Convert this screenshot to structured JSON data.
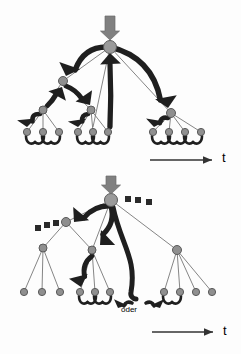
{
  "figure": {
    "title": "",
    "background_color": "#fdfdfd",
    "width": 241,
    "height": 354,
    "panels": [
      {
        "id": "top-panel",
        "name": "upper-tree-diagram",
        "description": "Tree with bold curved backtracking arrows",
        "axis": {
          "label": "t",
          "x1": 150,
          "x2": 212,
          "y": 160,
          "arrow": true
        },
        "input_arrow": {
          "x": 110,
          "y_top": 16,
          "y_bottom": 40,
          "color": "#808080"
        },
        "nodes": {
          "root": {
            "x": 110,
            "y": 47,
            "r": 6.5
          },
          "level1": [
            {
              "id": "L1a",
              "x": 63,
              "y": 81,
              "r": 4.5
            },
            {
              "id": "L1b",
              "x": 171,
              "y": 113,
              "r": 4.5
            }
          ],
          "level2": [
            {
              "id": "L2a",
              "x": 43,
              "y": 110,
              "r": 4
            },
            {
              "id": "L2b",
              "x": 91,
              "y": 110,
              "r": 4
            }
          ],
          "leaves": [
            {
              "x": 27,
              "y": 132
            },
            {
              "x": 43,
              "y": 132
            },
            {
              "x": 59,
              "y": 132
            },
            {
              "x": 78,
              "y": 132
            },
            {
              "x": 93,
              "y": 132
            },
            {
              "x": 108,
              "y": 132
            },
            {
              "x": 153,
              "y": 132
            },
            {
              "x": 169,
              "y": 132
            },
            {
              "x": 185,
              "y": 132
            },
            {
              "x": 201,
              "y": 132
            }
          ]
        },
        "curly_connectors": [
          {
            "from": 27,
            "to": 43,
            "y": 139
          },
          {
            "from": 43,
            "to": 59,
            "y": 139
          },
          {
            "from": 78,
            "to": 93,
            "y": 139
          },
          {
            "from": 93,
            "to": 108,
            "y": 139
          },
          {
            "from": 153,
            "to": 169,
            "y": 139
          },
          {
            "from": 169,
            "to": 185,
            "y": 139
          },
          {
            "from": 185,
            "to": 201,
            "y": 139
          }
        ],
        "bold_arrows": [
          {
            "name": "root-to-L1a-backtrack",
            "from": [
              110,
              47
            ],
            "to": [
              66,
              76
            ]
          },
          {
            "name": "root-to-L1b-backtrack",
            "from": [
              110,
              47
            ],
            "to": [
              168,
              108
            ]
          },
          {
            "name": "L2a-up-to-L1a",
            "from": [
              47,
              106
            ],
            "to": [
              62,
              87
            ]
          },
          {
            "name": "L1a-to-L2b",
            "from": [
              66,
              86
            ],
            "to": [
              90,
              105
            ]
          },
          {
            "name": "L2a-down-to-leaf",
            "from": [
              40,
              114
            ],
            "to": [
              27,
              127
            ]
          },
          {
            "name": "L2b-down-to-leaf",
            "from": [
              88,
              114
            ],
            "to": [
              78,
              127
            ]
          },
          {
            "name": "L1b-down-to-leaf",
            "from": [
              168,
              118
            ],
            "to": [
              154,
              127
            ]
          },
          {
            "name": "leaf-up-to-root",
            "from": [
              110,
              127
            ],
            "to": [
              110,
              53
            ]
          }
        ]
      },
      {
        "id": "bottom-panel",
        "name": "lower-tree-diagram",
        "description": "Tree with dashed square placeholders and oder alternative arrows",
        "axis": {
          "label": "t",
          "x1": 152,
          "x2": 213,
          "y": 332,
          "arrow": true
        },
        "input_arrow": {
          "x": 111,
          "y_top": 176,
          "y_bottom": 194,
          "color": "#808080"
        },
        "oder_label": "oder",
        "nodes": {
          "root": {
            "x": 111,
            "y": 200,
            "r": 6.5
          },
          "level1": [
            {
              "id": "B1a",
              "x": 66,
              "y": 222,
              "r": 4.5
            },
            {
              "id": "B1b",
              "x": 177,
              "y": 250,
              "r": 4.5
            }
          ],
          "level2": [
            {
              "id": "B2a",
              "x": 43,
              "y": 248,
              "r": 4
            },
            {
              "id": "B2b",
              "x": 92,
              "y": 250,
              "r": 4
            }
          ],
          "leaves": [
            {
              "x": 24,
              "y": 292
            },
            {
              "x": 42,
              "y": 292
            },
            {
              "x": 60,
              "y": 292
            },
            {
              "x": 80,
              "y": 292
            },
            {
              "x": 95,
              "y": 292
            },
            {
              "x": 110,
              "y": 292
            },
            {
              "x": 164,
              "y": 292
            },
            {
              "x": 180,
              "y": 292
            },
            {
              "x": 196,
              "y": 292
            },
            {
              "x": 212,
              "y": 292
            }
          ]
        },
        "dashed_squares_right": [
          {
            "x": 128,
            "y": 199
          },
          {
            "x": 138,
            "y": 200
          },
          {
            "x": 149,
            "y": 202
          }
        ],
        "dashed_squares_left": [
          {
            "x": 56,
            "y": 223
          },
          {
            "x": 47,
            "y": 225
          },
          {
            "x": 38,
            "y": 228
          }
        ],
        "curly_connectors": [
          {
            "from": 80,
            "to": 95,
            "y": 299
          },
          {
            "from": 95,
            "to": 110,
            "y": 299
          },
          {
            "from": 164,
            "to": 180,
            "y": 299
          }
        ],
        "oder_arrows": [
          {
            "name": "oder-left-arrow",
            "from": [
              132,
              303
            ],
            "to": [
              118,
              308
            ]
          },
          {
            "name": "oder-right-arrow",
            "from": [
              146,
              303
            ],
            "to": [
              160,
              308
            ]
          }
        ],
        "bold_arrows": [
          {
            "name": "root-to-B1a-backtrack",
            "from": [
              111,
              206
            ],
            "to": [
              74,
              222
            ]
          },
          {
            "name": "root-to-B2b-backtrack",
            "from": [
              111,
              206
            ],
            "to": [
              100,
              245
            ]
          },
          {
            "name": "B2b-down-to-leaf",
            "from": [
              92,
              256
            ],
            "to": [
              81,
              287
            ]
          },
          {
            "name": "long-curve-to-oder",
            "from": [
              113,
              207
            ],
            "to": [
              136,
              298
            ]
          }
        ]
      }
    ],
    "colors": {
      "node_fill": "#8f8f8f",
      "node_stroke": "#5a5a5a",
      "root_fill": "#9a9a9a",
      "thin_edge": "#777777",
      "bold_arrow": "#1f1f1f",
      "input_arrow": "#7d7d7d",
      "dashed_square": "#2a2a2a",
      "axis": "#333333",
      "background": "#fdfdfd"
    }
  }
}
